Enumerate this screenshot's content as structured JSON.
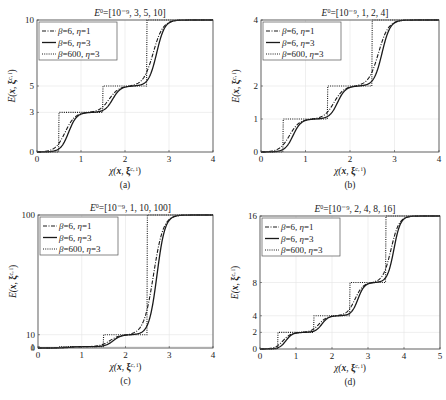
{
  "chart_data": [
    {
      "type": "line",
      "panel_label": "(a)",
      "title": "E⁰=[10⁻⁹, 3, 5, 10]",
      "xlabel": "χ(x, ξ^{c,i})",
      "ylabel": "E(x, ξ^{c,i})",
      "xlim": [
        0,
        4
      ],
      "ylim": [
        0,
        10
      ],
      "xticks": [
        0,
        1,
        2,
        3,
        4
      ],
      "yticks": [
        0,
        3,
        5,
        10
      ],
      "grid": true,
      "legend_position": "upper left",
      "levels": [
        0,
        3,
        5,
        10
      ],
      "series": [
        {
          "name": "β=6, η=1",
          "style": "dashdot",
          "beta": 6,
          "eta": 1
        },
        {
          "name": "β=6, η=3",
          "style": "solid",
          "beta": 6,
          "eta": 3
        },
        {
          "name": "β=600, η=3",
          "style": "dotted",
          "beta": 600,
          "eta": 3
        }
      ]
    },
    {
      "type": "line",
      "panel_label": "(b)",
      "title": "E⁰=[10⁻⁹, 1, 2, 4]",
      "xlabel": "χ(x, ξ^{c,i})",
      "ylabel": "E(x, ξ^{c,i})",
      "xlim": [
        0,
        4
      ],
      "ylim": [
        0,
        4
      ],
      "xticks": [
        0,
        1,
        2,
        3,
        4
      ],
      "yticks": [
        0,
        1,
        2,
        4
      ],
      "grid": true,
      "legend_position": "upper left",
      "levels": [
        0,
        1,
        2,
        4
      ],
      "series": [
        {
          "name": "β=6, η=1",
          "style": "dashdot",
          "beta": 6,
          "eta": 1
        },
        {
          "name": "β=6, η=3",
          "style": "solid",
          "beta": 6,
          "eta": 3
        },
        {
          "name": "β=600, η=3",
          "style": "dotted",
          "beta": 600,
          "eta": 3
        }
      ]
    },
    {
      "type": "line",
      "panel_label": "(c)",
      "title": "E⁰=[10⁻⁹, 1, 10, 100]",
      "xlabel": "χ(x, ξ^{c,i})",
      "ylabel": "E(x, ξ^{c,i})",
      "xlim": [
        0,
        4
      ],
      "ylim": [
        0,
        100
      ],
      "xticks": [
        0,
        1,
        2,
        3,
        4
      ],
      "yticks": [
        0,
        1,
        10,
        100
      ],
      "grid": true,
      "legend_position": "upper left",
      "levels": [
        0,
        1,
        10,
        100
      ],
      "series": [
        {
          "name": "β=6, η=1",
          "style": "dashdot",
          "beta": 6,
          "eta": 1
        },
        {
          "name": "β=6, η=3",
          "style": "solid",
          "beta": 6,
          "eta": 3
        },
        {
          "name": "β=600, η=3",
          "style": "dotted",
          "beta": 600,
          "eta": 3
        }
      ]
    },
    {
      "type": "line",
      "panel_label": "(d)",
      "title": "E⁰=[10⁻⁹, 2, 4, 8, 16]",
      "xlabel": "χ(x, ξ^{c,i})",
      "ylabel": "E(x, ξ^{c,i})",
      "xlim": [
        0,
        5
      ],
      "ylim": [
        0,
        16
      ],
      "xticks": [
        0,
        1,
        2,
        3,
        4,
        5
      ],
      "yticks": [
        0,
        2,
        4,
        8,
        16
      ],
      "grid": true,
      "legend_position": "upper left",
      "levels": [
        0,
        2,
        4,
        8,
        16
      ],
      "series": [
        {
          "name": "β=6, η=1",
          "style": "dashdot",
          "beta": 6,
          "eta": 1
        },
        {
          "name": "β=6, η=3",
          "style": "solid",
          "beta": 6,
          "eta": 3
        },
        {
          "name": "β=600, η=3",
          "style": "dotted",
          "beta": 600,
          "eta": 3
        }
      ]
    }
  ],
  "layout": {
    "panels": [
      {
        "left": 37,
        "top": 20,
        "right": 213,
        "bottom": 152
      },
      {
        "left": 261,
        "top": 20,
        "right": 439,
        "bottom": 152
      },
      {
        "left": 38,
        "top": 215,
        "right": 213,
        "bottom": 348
      },
      {
        "left": 260,
        "top": 216,
        "right": 440,
        "bottom": 349
      }
    ]
  }
}
